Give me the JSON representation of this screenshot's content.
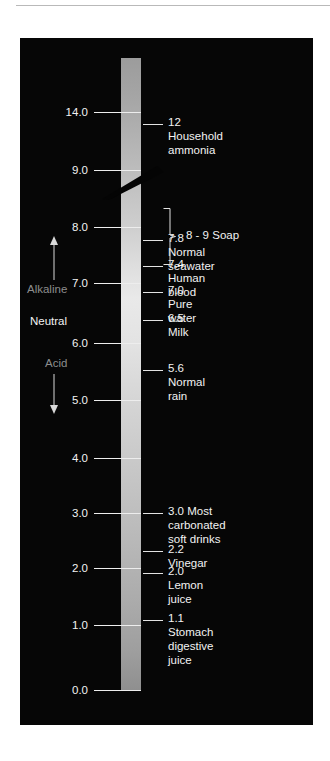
{
  "figure": {
    "background_color": "#060606",
    "bar": {
      "name": "ph-gradient-bar",
      "top_value": "14.0",
      "bottom_value": "0.0"
    }
  },
  "axis": {
    "label_color": "#f2f2f2",
    "ticks": [
      {
        "value": "14.0",
        "y": 112
      },
      {
        "value": "9.0",
        "y": 170
      },
      {
        "value": "8.0",
        "y": 227
      },
      {
        "value": "7.0",
        "y": 283
      },
      {
        "value": "6.0",
        "y": 343
      },
      {
        "value": "5.0",
        "y": 400
      },
      {
        "value": "4.0",
        "y": 458
      },
      {
        "value": "3.0",
        "y": 513
      },
      {
        "value": "2.0",
        "y": 568
      },
      {
        "value": "1.0",
        "y": 625
      },
      {
        "value": "0.0",
        "y": 690
      }
    ]
  },
  "regions": {
    "alkaline_label": "Alkaline",
    "neutral_label": "Neutral",
    "acid_label": "Acid",
    "muted_color": "#8d8d8d"
  },
  "callouts": [
    {
      "text": "12 Household ammonia",
      "y": 124
    },
    {
      "text": "7.8 Normal seawater",
      "y": 240
    },
    {
      "text": "7.4 Human blood",
      "y": 266
    },
    {
      "text": "7.0 Pure water",
      "y": 292
    },
    {
      "text": "6.5 Milk",
      "y": 320
    },
    {
      "text": "5.6 Normal rain",
      "y": 370
    },
    {
      "text": "3.0 Most carbonated\nsoft drinks",
      "y": 513
    },
    {
      "text": "2.2 Vinegar",
      "y": 551
    },
    {
      "text": "2.0 Lemon juice",
      "y": 573
    },
    {
      "text": "1.1 Stomach digestive juice",
      "y": 620
    }
  ],
  "brace": {
    "label": "8 - 9 Soap",
    "range_top": "9.0",
    "range_bottom": "8.0"
  },
  "chart_data": {
    "type": "scatter",
    "xlabel": "",
    "ylabel": "pH",
    "ylim": [
      0.0,
      14.0
    ],
    "grid": false,
    "legend": "none",
    "orientation": "vertical",
    "tick_values": [
      14.0,
      9.0,
      8.0,
      7.0,
      6.0,
      5.0,
      4.0,
      3.0,
      2.0,
      1.0,
      0.0
    ],
    "annotations": [
      "Alkaline",
      "Neutral",
      "Acid"
    ],
    "categories": [
      "Household ammonia",
      "Soap",
      "Normal seawater",
      "Human blood",
      "Pure water",
      "Milk",
      "Normal rain",
      "Most carbonated soft drinks",
      "Vinegar",
      "Lemon juice",
      "Stomach digestive juice"
    ],
    "values": [
      12,
      8.5,
      7.8,
      7.4,
      7.0,
      6.5,
      5.6,
      3.0,
      2.2,
      2.0,
      1.1
    ],
    "value_labels": [
      "12",
      "8 - 9",
      "7.8",
      "7.4",
      "7.0",
      "6.5",
      "5.6",
      "3.0",
      "2.2",
      "2.0",
      "1.1"
    ]
  }
}
